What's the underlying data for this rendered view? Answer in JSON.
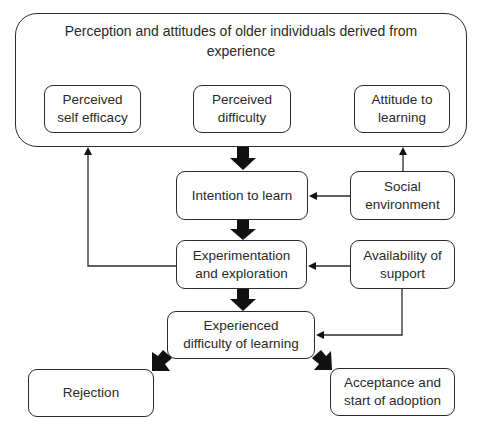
{
  "outer": {
    "title_line1": "Perception and attitudes of older individuals derived from",
    "title_line2": "experience",
    "items": [
      {
        "line1": "Perceived",
        "line2": "self efficacy"
      },
      {
        "line1": "Perceived",
        "line2": "difficulty"
      },
      {
        "line1": "Attitude to",
        "line2": "learning"
      }
    ]
  },
  "nodes": {
    "intention": {
      "line1": "Intention to learn"
    },
    "social": {
      "line1": "Social",
      "line2": "environment"
    },
    "experimentation": {
      "line1": "Experimentation",
      "line2": "and exploration"
    },
    "support": {
      "line1": "Availability of",
      "line2": "support"
    },
    "experienced": {
      "line1": "Experienced",
      "line2": "difficulty of learning"
    },
    "rejection": {
      "line1": "Rejection"
    },
    "acceptance": {
      "line1": "Acceptance and",
      "line2": "start of adoption"
    }
  },
  "colors": {
    "stroke": "#2b2b2b",
    "arrow_fill": "#111111"
  }
}
